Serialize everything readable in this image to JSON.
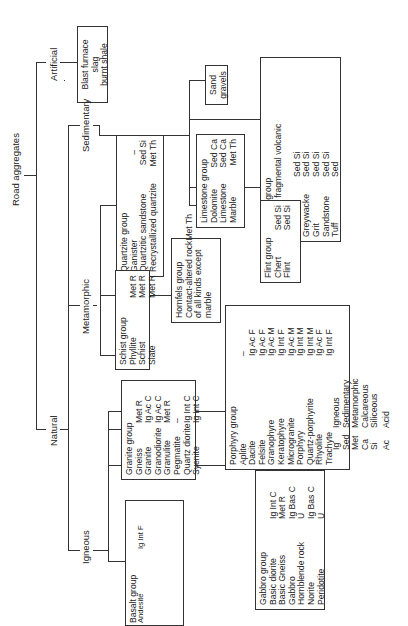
{
  "root": "Road aggregates",
  "branches": {
    "natural": "Natural",
    "artificial": "Artificial",
    "igneous": "Igneous",
    "metamorphic": "Metamorphic",
    "sedimentary": "Sedimentary"
  },
  "artificial_box": {
    "lines": [
      "Blast furnace slag",
      "burnt shale"
    ]
  },
  "sand_box": {
    "lines": [
      "Sand",
      "gravels"
    ]
  },
  "groups": {
    "gritstone": {
      "title": "Gritstone group",
      "subtitle": [
        "(including fragmental volcanic",
        "rocks)"
      ],
      "rows": [
        {
          "name": "Arkose",
          "code": "Sed Si"
        },
        {
          "name": "Greywacke",
          "code": "Sed Si"
        },
        {
          "name": "Grit",
          "code": "Sed Si"
        },
        {
          "name": "Sandstone",
          "code": "Sed Si"
        },
        {
          "name": "Tuff",
          "code": "Sed"
        }
      ]
    },
    "limestone": {
      "title": "Limestone group",
      "rows": [
        {
          "name": "Dolomite",
          "code": "Sed Ca"
        },
        {
          "name": "Limestone",
          "code": "Sed Ca"
        },
        {
          "name": "Marble",
          "code": "Met Th"
        }
      ]
    },
    "flint": {
      "title": "Flint group",
      "rows": [
        {
          "name": "Chert",
          "code": "Sed Si"
        },
        {
          "name": "Flint",
          "code": "Sed Si"
        }
      ]
    },
    "quartzite": {
      "title": "Quartzite group",
      "rows": [
        {
          "name": "Ganister",
          "code": "Sed Si"
        },
        {
          "name": "Quartzitic sandstone",
          "code": "Sed Si"
        },
        {
          "name": "Recrystallized quartzite",
          "code": "Met Th"
        }
      ]
    },
    "hornfels": {
      "title": "Hornfels group",
      "lines": [
        "Contact-altered rock",
        "of all kinds except",
        "marble"
      ],
      "code": "Met Th"
    },
    "schist": {
      "title": "Schist group",
      "rows": [
        {
          "name": "Phyllite",
          "code": "Met R"
        },
        {
          "name": "Schist",
          "code": "Met R"
        },
        {
          "name": "Slate",
          "code": "Met R"
        }
      ]
    },
    "porphyry": {
      "title": "Porphyry group",
      "rows": [
        {
          "name": "Aplite",
          "code": "–"
        },
        {
          "name": "Dacite",
          "code": "Ig Ac F"
        },
        {
          "name": "Felsite",
          "code": "Ig Ac F"
        },
        {
          "name": "Granophyre",
          "code": "Ig Ac M"
        },
        {
          "name": "Keratophyre",
          "code": "Ig Int F"
        },
        {
          "name": "Microgranite",
          "code": "Ig Ac M"
        },
        {
          "name": "Porphyry",
          "code": "Ig Int M"
        },
        {
          "name": "Quartz-porphyrite",
          "code": "Ig Int M"
        },
        {
          "name": "Rhyolite",
          "code": "Ig Ac F"
        },
        {
          "name": "Trachyte",
          "code": "Ig Int F"
        }
      ]
    },
    "granite": {
      "title": "Granite group",
      "rows": [
        {
          "name": "Gneiss",
          "code": "Met R"
        },
        {
          "name": "Granite",
          "code": "Ig Ac C"
        },
        {
          "name": "Granodiorite",
          "code": "Ig Ac C"
        },
        {
          "name": "Granulite",
          "code": "Met R"
        },
        {
          "name": "Pegmatite",
          "code": "–"
        },
        {
          "name": "Quartz diorite",
          "code": "Ig Int C"
        },
        {
          "name": "Syenite",
          "code": "Ig Int C"
        }
      ]
    },
    "basalt": {
      "title": "Basalt group",
      "rows": [
        {
          "name": "Andesite",
          "code": "Ig Int F"
        },
        {
          "name": "Basalt",
          "code": "Ig Bas F"
        },
        {
          "name": "Basalt porphyrite",
          "code": "Ig Int M"
        },
        {
          "name": "Diabase",
          "code": "Ig Bas M"
        },
        {
          "name": "Dolerite",
          "code": "Ig Bas M"
        },
        {
          "name": "Epidiorite",
          "code": "Met R"
        },
        {
          "name": "Lamprophyre",
          "code": "Ig Bas"
        },
        {
          "name": "Quartz dolerite",
          "code": "Ig Bas M"
        },
        {
          "name": "Spilite",
          "code": "Ig Bas F"
        },
        {
          "name": "Teschenite",
          "code": "Ig Bas"
        },
        {
          "name": "Theralite",
          "code": "Ig Bas"
        }
      ]
    },
    "gabbro": {
      "title": "Gabbro group",
      "rows": [
        {
          "name": "Basic diorite",
          "code": "Ig Int C"
        },
        {
          "name": "Basic Gneiss",
          "code": "Met R"
        },
        {
          "name": "Gabbro",
          "code": "Ig Bas C"
        },
        {
          "name": "Hornblende rock",
          "code": "U"
        },
        {
          "name": "Norite",
          "code": "Ig Bas C"
        },
        {
          "name": "Peridotite",
          "code": "U"
        },
        {
          "name": "Picrite",
          "code": "U"
        },
        {
          "name": "Serpentinite",
          "code": "–"
        }
      ]
    }
  },
  "legend": {
    "origin": [
      {
        "k": "Ig",
        "v": "Igneous"
      },
      {
        "k": "Sed",
        "v": "Sedimentary"
      },
      {
        "k": "Met",
        "v": "Metamorphic"
      },
      {
        "k": "Ca",
        "v": "Calcareous"
      },
      {
        "k": "Si",
        "v": "Siliceous"
      }
    ],
    "composition": [
      {
        "k": "Ac",
        "v": "Acid"
      },
      {
        "k": "Int",
        "v": "Intermediate"
      },
      {
        "k": "Bas",
        "v": "Basic"
      },
      {
        "k": "U",
        "v": "Ultrabasic"
      }
    ],
    "grain": [
      {
        "k": "C",
        "v": "Coarse-grained"
      },
      {
        "k": "M",
        "v": "Medium-grained"
      },
      {
        "k": "F",
        "v": "Fine-grained"
      },
      {
        "k": "Th",
        "v": "Thermal"
      },
      {
        "k": "R",
        "v": "Regional"
      }
    ]
  }
}
